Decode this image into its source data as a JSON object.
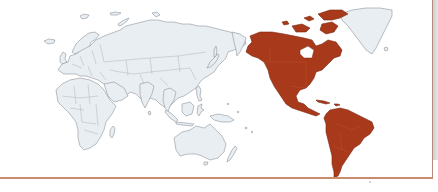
{
  "map": {
    "type": "world-map",
    "projection": "pacific-centered",
    "highlighted_region": "Americas",
    "regions": [
      {
        "name": "Europe",
        "highlighted": false
      },
      {
        "name": "Africa",
        "highlighted": false
      },
      {
        "name": "Asia",
        "highlighted": false
      },
      {
        "name": "Oceania",
        "highlighted": false
      },
      {
        "name": "Greenland",
        "highlighted": false
      },
      {
        "name": "North America",
        "highlighted": true
      },
      {
        "name": "Central America",
        "highlighted": true
      },
      {
        "name": "South America",
        "highlighted": true
      }
    ],
    "colors": {
      "highlight": "#a8391a",
      "land": "#e9eef3",
      "land_outline": "#8d949b",
      "background": "#ffffff",
      "frame_rule": "#c98a6d"
    }
  }
}
